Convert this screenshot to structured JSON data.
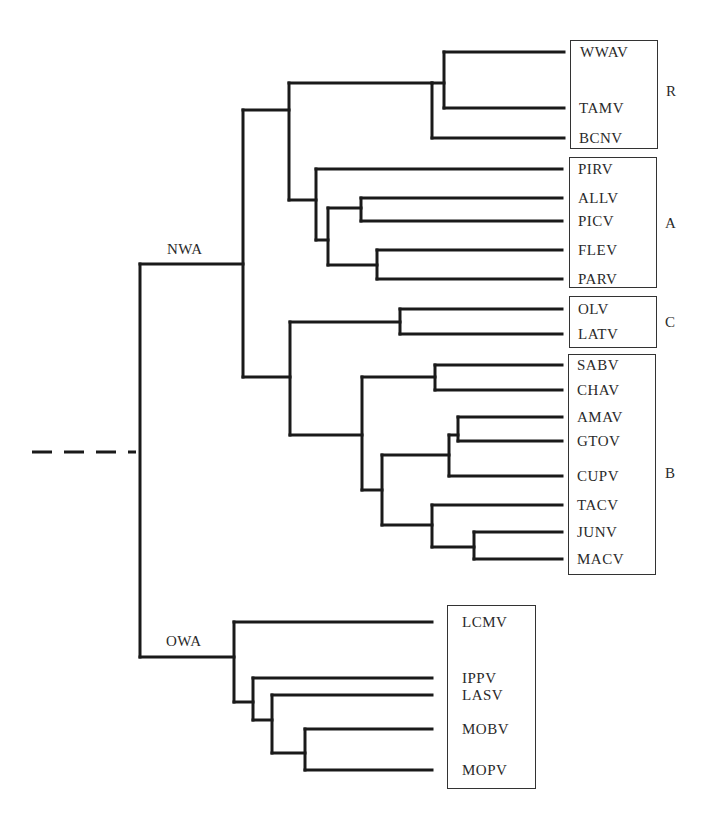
{
  "diagram": {
    "type": "phylogenetic-tree",
    "root_label": "",
    "clades": {
      "nwa": "NWA",
      "owa": "OWA"
    },
    "groups": [
      {
        "id": "R",
        "label": "R",
        "members": [
          "WWAV",
          "TAMV",
          "BCNV"
        ]
      },
      {
        "id": "A",
        "label": "A",
        "members": [
          "PIRV",
          "ALLV",
          "PICV",
          "FLEV",
          "PARV"
        ]
      },
      {
        "id": "C",
        "label": "C",
        "members": [
          "OLV",
          "LATV"
        ]
      },
      {
        "id": "B",
        "label": "B",
        "members": [
          "SABV",
          "CHAV",
          "AMAV",
          "GTOV",
          "CUPV",
          "TACV",
          "JUNV",
          "MACV"
        ]
      },
      {
        "id": "OWA",
        "label": "",
        "members": [
          "LCMV",
          "IPPV",
          "LASV",
          "MOBV",
          "MOPV"
        ]
      }
    ],
    "leaves": {
      "wwav": "WWAV",
      "tamv": "TAMV",
      "bcnv": "BCNV",
      "pirv": "PIRV",
      "allv": "ALLV",
      "picv": "PICV",
      "flev": "FLEV",
      "parv": "PARV",
      "olv": "OLV",
      "latv": "LATV",
      "sabv": "SABV",
      "chav": "CHAV",
      "amav": "AMAV",
      "gtov": "GTOV",
      "cupv": "CUPV",
      "tacv": "TACV",
      "junv": "JUNV",
      "macv": "MACV",
      "lcmv": "LCMV",
      "ippv": "IPPV",
      "lasv": "LASV",
      "mobv": "MOBV",
      "mopv": "MOPV"
    },
    "group_labels": {
      "r": "R",
      "a": "A",
      "c": "C",
      "b": "B"
    },
    "newick": "(((((WWAV,TAMV),BCNV),(PIRV,((ALLV,PICV),(FLEV,PARV)))),((OLV,LATV),((SABV,CHAV),(((AMAV,GTOV),CUPV),(TACV,(JUNV,MACV)))))),(LCMV,(IPPV,(LASV,(MOBV,MOPV)))));",
    "colors": {
      "line": "#1a1a1a",
      "text": "#2a2a2a",
      "background": "#ffffff"
    }
  }
}
